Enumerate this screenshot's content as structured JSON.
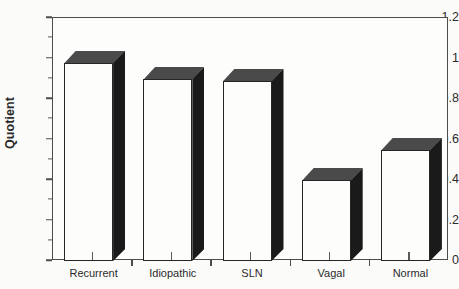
{
  "chart_data": {
    "type": "bar",
    "title": "",
    "subtitle": "",
    "xlabel": "",
    "ylabel": "Quotient",
    "categories": [
      "Recurrent",
      "Idiopathic",
      "SLN",
      "Vagal",
      "Normal"
    ],
    "values": [
      0.98,
      0.9,
      0.89,
      0.4,
      0.55
    ],
    "series": [
      {
        "name": "Quotient",
        "values": [
          0.98,
          0.9,
          0.89,
          0.4,
          0.55
        ]
      }
    ],
    "ylim": [
      0,
      1.2
    ],
    "xlim": [
      0,
      5
    ],
    "y_ticks": [
      0,
      0.2,
      0.4,
      0.6,
      0.8,
      1,
      1.2
    ],
    "y_tick_labels": [
      "0",
      "0.2",
      "0.4",
      "0.6",
      "0.8",
      "1",
      "1.2"
    ],
    "y_minor_ticks": [
      0.1,
      0.3,
      0.5,
      0.7,
      0.9,
      1.1
    ],
    "grid": false,
    "legend": false,
    "legend_position": "none",
    "style": "3d-bar",
    "annotations": []
  },
  "axes": {
    "y_title": "Quotient",
    "y_tick_labels": [
      "1.2",
      "1",
      "0.8",
      "0.6",
      "0.4",
      "0.2",
      "0"
    ]
  },
  "colors": {
    "background": "#fbfbf9",
    "plot_background": "#fdfdfb",
    "frame": "#4d4d4d",
    "bar_front": "#fdfdfb",
    "bar_front_edge": "#262626",
    "bar_top": "#4a4a4a",
    "bar_side": "#1a1a1a",
    "text": "#2b2b2b"
  }
}
